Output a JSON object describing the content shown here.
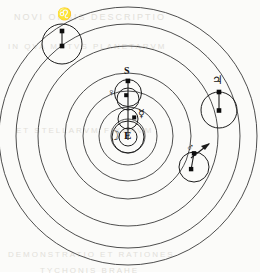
{
  "figure": {
    "background_color": "#fbfbf9",
    "line_color": "#3a3a3a",
    "ink_color": "#121212"
  },
  "center": {
    "cx": 128,
    "cy": 136
  },
  "orbits": [
    {
      "name": "moon-orbit",
      "radius": 17,
      "label": "Moon orbit"
    },
    {
      "name": "mercury-orbit",
      "radius": 29,
      "label": "Mercury orbit"
    },
    {
      "name": "venus-orbit",
      "radius": 45,
      "label": "Venus orbit"
    },
    {
      "name": "sun-orbit",
      "radius": 63,
      "label": "Sun orbit"
    },
    {
      "name": "mars-orbit",
      "radius": 90,
      "label": "Mars orbit"
    },
    {
      "name": "jupiter-orbit",
      "radius": 112,
      "label": "Jupiter orbit"
    },
    {
      "name": "saturn-orbit",
      "radius": 129,
      "label": "Saturn orbit"
    }
  ],
  "bodies": {
    "earth": {
      "symbol": "E",
      "label": "E",
      "x": 128,
      "y": 137,
      "epicycle_r": 16
    },
    "moon": {
      "symbol": "☽",
      "label": "Moon",
      "x": 114,
      "y": 137
    },
    "sun": {
      "symbol": "S",
      "label": "S",
      "x": 128,
      "y": 81,
      "epicycle_r": 14,
      "epicycle_cy": 97
    },
    "venus": {
      "symbol": "♀",
      "label": "Venus",
      "x": 114,
      "y": 95,
      "dot_x": 126,
      "dot_y": 95,
      "epicycle_r": 11,
      "epicycle_cx": 128,
      "epicycle_cy": 99
    },
    "mercury": {
      "symbol": "☿",
      "label": "Mercury",
      "x": 144,
      "y": 116,
      "dot_x": 134,
      "dot_y": 117,
      "epicycle_r": 10,
      "epicycle_cx": 128,
      "epicycle_cy": 119
    },
    "mars": {
      "symbol": "♂",
      "label": "Mars",
      "x": 192,
      "y": 152,
      "epicycle_cx": 194,
      "epicycle_cy": 167,
      "epicycle_r": 15,
      "dot1_x": 194,
      "dot1_y": 153,
      "dot2_x": 194,
      "dot2_y": 168
    },
    "jupiter": {
      "symbol": "♃",
      "label": "Jupiter",
      "x": 215,
      "y": 85,
      "epicycle_cx": 219,
      "epicycle_cy": 110,
      "epicycle_r": 17,
      "dot1_x": 219,
      "dot1_y": 92,
      "dot2_x": 219,
      "dot2_y": 110
    },
    "saturn": {
      "symbol": "♌",
      "label": "Saturn",
      "x": 62,
      "y": 17,
      "epicycle_cx": 62,
      "epicycle_cy": 44,
      "epicycle_r": 20,
      "dot1_x": 62,
      "dot1_y": 31,
      "dot2_x": 62,
      "dot2_y": 46
    }
  },
  "ghost_text": [
    {
      "text": "NOVI ORBIS DESCRIPTIO",
      "x": 14,
      "y": 12,
      "size": 9
    },
    {
      "text": "IN QVA MOTVS PLANETARVM",
      "x": 8,
      "y": 42,
      "size": 8
    },
    {
      "text": "ET STELLARVM FIXARVM",
      "x": 16,
      "y": 126,
      "size": 8
    },
    {
      "text": "DEMONSTRATIO ET RATIONES",
      "x": 8,
      "y": 250,
      "size": 8
    },
    {
      "text": "TYCHONIS BRAHE",
      "x": 40,
      "y": 266,
      "size": 8
    }
  ]
}
